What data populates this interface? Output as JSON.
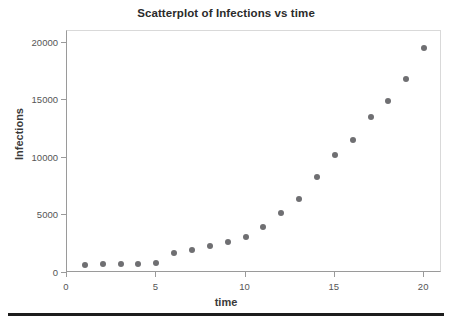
{
  "chart_data": {
    "type": "scatter",
    "title": "Scatterplot of Infections vs time",
    "xlabel": "time",
    "ylabel": "Infections",
    "xlim": [
      0,
      21
    ],
    "ylim": [
      0,
      21000
    ],
    "xticks": [
      0,
      5,
      10,
      15,
      20
    ],
    "yticks": [
      0,
      5000,
      10000,
      15000,
      20000
    ],
    "xtick_labels": [
      "0",
      "5",
      "10",
      "15",
      "20"
    ],
    "ytick_labels": [
      "0",
      "5000",
      "10000",
      "15000",
      "20000"
    ],
    "grid": false,
    "legend": null,
    "marker_color": "#6f6f72",
    "series": [
      {
        "name": "Infections",
        "x": [
          1,
          2,
          3,
          4,
          5,
          6,
          7,
          8,
          9,
          10,
          11,
          12,
          13,
          14,
          15,
          16,
          17,
          18,
          19,
          20
        ],
        "values": [
          700,
          750,
          800,
          800,
          850,
          1700,
          2000,
          2300,
          2700,
          3100,
          4000,
          5200,
          6400,
          8300,
          10200,
          11500,
          13500,
          14900,
          16800,
          19500
        ]
      }
    ]
  },
  "figure": {
    "background_color": "#ffffff",
    "frame_color": "#d9d9d9",
    "axis_color": "#9a9a9a",
    "title_color": "#2b2b2b",
    "rule_color": "#1c1c1c"
  }
}
